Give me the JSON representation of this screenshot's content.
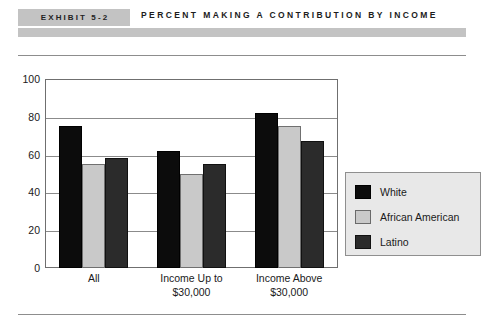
{
  "header": {
    "badge_label": "EXHIBIT 5-2",
    "title": "PERCENT MAKING A CONTRIBUTION BY INCOME"
  },
  "chart_data": {
    "type": "bar",
    "title": "PERCENT MAKING A CONTRIBUTION BY INCOME",
    "xlabel": "",
    "ylabel": "",
    "ylim": [
      0,
      100
    ],
    "ytick_labels": [
      "100",
      "80",
      "60",
      "40",
      "20",
      "0"
    ],
    "ytick_values": [
      100,
      80,
      60,
      40,
      20,
      0
    ],
    "grid": true,
    "legend_position": "right",
    "categories": [
      "All",
      "Income Up to $30,000",
      "Income Above $30,000"
    ],
    "category_lines": [
      [
        "All"
      ],
      [
        "Income Up to",
        "$30,000"
      ],
      [
        "Income Above",
        "$30,000"
      ]
    ],
    "series": [
      {
        "name": "White",
        "color": "#0c0c0c",
        "values": [
          75,
          62,
          82
        ]
      },
      {
        "name": "African American",
        "color": "#c9c9c9",
        "values": [
          55,
          50,
          75
        ]
      },
      {
        "name": "Latino",
        "color": "#2b2b2b",
        "values": [
          58,
          55,
          67
        ]
      }
    ]
  }
}
